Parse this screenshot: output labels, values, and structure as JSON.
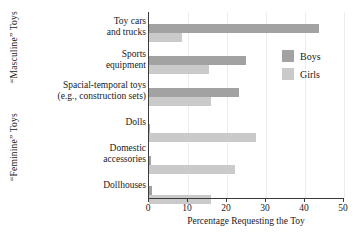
{
  "chart_data": {
    "type": "bar",
    "orientation": "horizontal",
    "title": "",
    "xlabel": "Percentage Requesting the Toy",
    "ylabel": "",
    "xlim": [
      0,
      50
    ],
    "xticks": [
      0,
      10,
      20,
      30,
      40,
      50
    ],
    "xtick_labels": [
      "0",
      "10",
      "20",
      "30",
      "40",
      "50"
    ],
    "gridlines": [
      "10",
      "20",
      "30",
      "40",
      "50"
    ],
    "grid": true,
    "legend_position": "upper right",
    "categories": [
      "Toy cars and trucks",
      "Sports equipment",
      "Spacial-temporal toys (e.g., construction sets)",
      "Dolls",
      "Domestic accessories",
      "Dollhouses"
    ],
    "category_lines": [
      [
        "Toy cars",
        "and trucks"
      ],
      [
        "Sports",
        "equipment"
      ],
      [
        "Spacial-temporal toys",
        "(e.g., construction sets)"
      ],
      [
        "Dolls",
        ""
      ],
      [
        "Domestic",
        "accessories"
      ],
      [
        "Dollhouses",
        ""
      ]
    ],
    "series": [
      {
        "name": "Boys",
        "color": "#a2a2a2",
        "values": [
          43.6,
          24.8,
          23.0,
          0.3,
          0.4,
          0.8
        ]
      },
      {
        "name": "Girls",
        "color": "#cacaca",
        "values": [
          8.5,
          15.3,
          15.8,
          27.4,
          22.0,
          15.8
        ]
      }
    ],
    "group_labels": [
      {
        "text": "“Masculine” Toys",
        "categories": [
          "Toy cars and trucks",
          "Sports equipment",
          "Spacial-temporal toys (e.g., construction sets)"
        ]
      },
      {
        "text": "“Feminine” Toys",
        "categories": [
          "Dolls",
          "Domestic accessories",
          "Dollhouses"
        ]
      }
    ]
  },
  "legend": {
    "items": [
      {
        "label": "Boys",
        "color": "#a2a2a2"
      },
      {
        "label": "Girls",
        "color": "#cacaca"
      }
    ]
  },
  "axis": {
    "x_title": "Percentage Requesting the Toy"
  }
}
